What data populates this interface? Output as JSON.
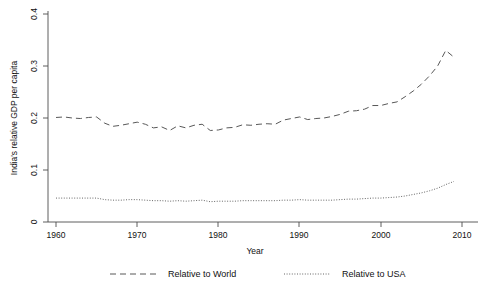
{
  "chart_data": {
    "type": "line",
    "title": "",
    "xlabel": "Year",
    "ylabel": "India's relative GDP per capita",
    "xlim": [
      1960,
      2010
    ],
    "ylim": [
      0,
      0.4
    ],
    "xticks": [
      "1960",
      "1970",
      "1980",
      "1990",
      "2000",
      "2010"
    ],
    "xtick_values": [
      1960,
      1970,
      1980,
      1990,
      2000,
      2010
    ],
    "yticks": [
      "0",
      "0.1",
      "0.2",
      "0.3",
      "0.4"
    ],
    "ytick_values": [
      0,
      0.1,
      0.2,
      0.3,
      0.4
    ],
    "grid": false,
    "legend_position": "bottom",
    "x": [
      1960,
      1961,
      1962,
      1963,
      1964,
      1965,
      1966,
      1967,
      1968,
      1969,
      1970,
      1971,
      1972,
      1973,
      1974,
      1975,
      1976,
      1977,
      1978,
      1979,
      1980,
      1981,
      1982,
      1983,
      1984,
      1985,
      1986,
      1987,
      1988,
      1989,
      1990,
      1991,
      1992,
      1993,
      1994,
      1995,
      1996,
      1997,
      1998,
      1999,
      2000,
      2001,
      2002,
      2003,
      2004,
      2005,
      2006,
      2007,
      2008,
      2009
    ],
    "series": [
      {
        "name": "Relative to World",
        "style": "dashed",
        "color": "#585858",
        "values": [
          0.201,
          0.202,
          0.2,
          0.199,
          0.201,
          0.202,
          0.19,
          0.184,
          0.186,
          0.189,
          0.192,
          0.188,
          0.181,
          0.183,
          0.176,
          0.185,
          0.181,
          0.186,
          0.188,
          0.176,
          0.177,
          0.181,
          0.182,
          0.187,
          0.186,
          0.188,
          0.189,
          0.188,
          0.196,
          0.199,
          0.202,
          0.197,
          0.199,
          0.2,
          0.203,
          0.207,
          0.213,
          0.214,
          0.217,
          0.224,
          0.224,
          0.228,
          0.231,
          0.241,
          0.252,
          0.265,
          0.281,
          0.3,
          0.33,
          0.317
        ]
      },
      {
        "name": "Relative to USA",
        "style": "dotted",
        "color": "#666666",
        "values": [
          0.046,
          0.046,
          0.046,
          0.046,
          0.046,
          0.046,
          0.043,
          0.042,
          0.042,
          0.043,
          0.043,
          0.042,
          0.041,
          0.041,
          0.04,
          0.041,
          0.04,
          0.041,
          0.042,
          0.039,
          0.04,
          0.04,
          0.04,
          0.041,
          0.041,
          0.041,
          0.041,
          0.041,
          0.042,
          0.042,
          0.043,
          0.042,
          0.042,
          0.042,
          0.042,
          0.043,
          0.044,
          0.044,
          0.045,
          0.046,
          0.046,
          0.047,
          0.048,
          0.05,
          0.053,
          0.056,
          0.06,
          0.065,
          0.072,
          0.078
        ]
      }
    ]
  },
  "legend": {
    "items": [
      {
        "label": "Relative to World"
      },
      {
        "label": "Relative to USA"
      }
    ]
  }
}
